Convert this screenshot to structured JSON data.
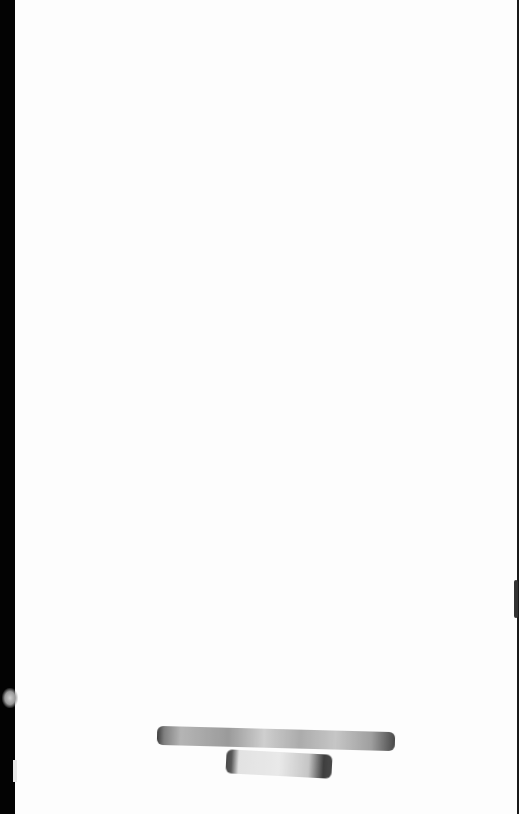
{
  "page": {
    "type": "scanned-blank-page",
    "text_content": "",
    "marks": [
      {
        "name": "redaction-stroke-top",
        "description": "horizontal smudged marker stroke"
      },
      {
        "name": "redaction-stroke-bottom",
        "description": "short smudged marker stroke below"
      }
    ],
    "colors": {
      "paper": "#fdfdfd",
      "scan-border": "#030303",
      "marker": "#8a8a8a"
    }
  }
}
